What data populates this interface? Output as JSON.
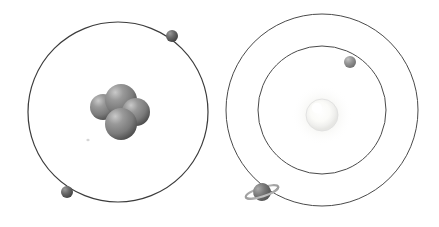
{
  "figure": {
    "width": 439,
    "height": 227,
    "background_color": "#ffffff",
    "orbit_stroke_color": "#3c3c3c",
    "orbit_stroke_width": 1.1
  },
  "panels": [
    {
      "id": "atom-model",
      "label": "Atom model (helium)",
      "center": {
        "x": 118,
        "y": 112
      },
      "orbits": [
        {
          "name": "electron-shell-1",
          "radius": 90,
          "stroke_color": "#3c3c3c",
          "stroke_width": 1.2
        }
      ],
      "nucleus": {
        "name": "nucleus",
        "particle_count": 4,
        "particle_color": "#7c7c7c",
        "particle_highlight_color": "#bdbdbd",
        "particle_shadow_color": "#4a4a4a",
        "particles": [
          {
            "name": "nucleon-back-left",
            "cx": 103,
            "cy": 107,
            "r": 13
          },
          {
            "name": "nucleon-top",
            "cx": 121,
            "cy": 100,
            "r": 16
          },
          {
            "name": "nucleon-right",
            "cx": 136,
            "cy": 112,
            "r": 14
          },
          {
            "name": "nucleon-front",
            "cx": 121,
            "cy": 124,
            "r": 16
          }
        ]
      },
      "electrons": [
        {
          "name": "electron-upper-right",
          "cx": 172,
          "cy": 36,
          "r": 6,
          "color": "#5a5a5a"
        },
        {
          "name": "electron-lower-left",
          "cx": 67,
          "cy": 192,
          "r": 6,
          "color": "#5a5a5a"
        }
      ]
    },
    {
      "id": "solar-system-model",
      "label": "Solar system model",
      "center": {
        "x": 322,
        "y": 110
      },
      "orbits": [
        {
          "name": "inner-orbit",
          "radius": 64,
          "stroke_color": "#4a4a4a",
          "stroke_width": 1.0
        },
        {
          "name": "outer-orbit",
          "radius": 96,
          "stroke_color": "#4a4a4a",
          "stroke_width": 1.0
        }
      ],
      "star": {
        "name": "sun",
        "cx": 322,
        "cy": 115,
        "r": 16,
        "core_color": "#ffffff",
        "glow_color": "#f2f2f0",
        "rim_color": "#e0e0e0"
      },
      "planets": [
        {
          "name": "inner-planet",
          "cx": 350,
          "cy": 62,
          "r": 6,
          "color": "#8a8a8a",
          "has_ring": false
        },
        {
          "name": "ringed-planet",
          "cx": 262,
          "cy": 192,
          "r": 9,
          "color": "#6f6f6f",
          "has_ring": true,
          "ring_color": "#a8a8a8",
          "ring_rx": 17,
          "ring_ry": 4.5,
          "ring_tilt_deg": -18
        }
      ]
    }
  ]
}
